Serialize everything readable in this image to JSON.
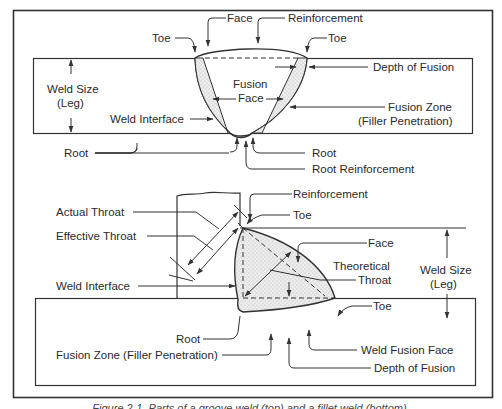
{
  "figure": {
    "caption": "Figure 2-1. Parts of a groove weld (top) and a fillet weld (bottom).",
    "colors": {
      "line": "#333333",
      "fill_stipple": "#e6e6e6",
      "text": "#2a2a2a",
      "background": "#ffffff"
    }
  },
  "groove_weld": {
    "labels": {
      "face": "Face",
      "reinforcement": "Reinforcement",
      "toe_left": "Toe",
      "toe_right": "Toe",
      "depth_of_fusion": "Depth of Fusion",
      "weld_size_line1": "Weld Size",
      "weld_size_line2": "(Leg)",
      "fusion_face_line1": "Fusion",
      "fusion_face_line2": "Face",
      "weld_interface": "Weld Interface",
      "fusion_zone_line1": "Fusion Zone",
      "fusion_zone_line2": "(Filler Penetration)",
      "root_left": "Root",
      "root_right": "Root",
      "root_reinforcement": "Root Reinforcement"
    }
  },
  "fillet_weld": {
    "labels": {
      "reinforcement": "Reinforcement",
      "actual_throat": "Actual Throat",
      "toe_top": "Toe",
      "effective_throat": "Effective Throat",
      "face": "Face",
      "theoretical_throat_line1": "Theoretical",
      "theoretical_throat_line2": "Throat",
      "weld_size_line1": "Weld Size",
      "weld_size_line2": "(Leg)",
      "weld_interface": "Weld Interface",
      "toe_right": "Toe",
      "root": "Root",
      "weld_fusion_face": "Weld Fusion Face",
      "fusion_zone": "Fusion Zone (Filler Penetration)",
      "depth_of_fusion": "Depth of Fusion"
    }
  }
}
